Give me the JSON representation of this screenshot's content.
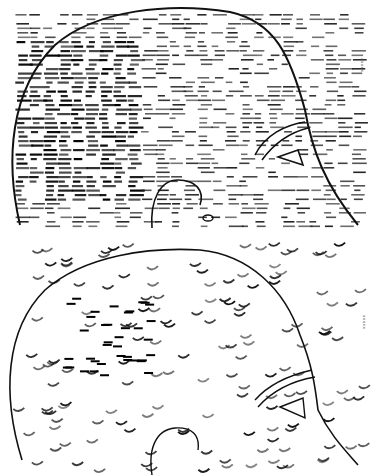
{
  "figure": {
    "panels": [
      {
        "id": "top",
        "label": "a",
        "side_label": "upper head map",
        "mark_style": "dash",
        "y_offset": 0,
        "height": 235,
        "ink": "#111111"
      },
      {
        "id": "bottom",
        "label": "b",
        "side_label": "lower head map",
        "mark_style": "arc",
        "y_offset": 235,
        "height": 240,
        "ink": "#111111"
      }
    ],
    "corner_text_top": "xxxxx",
    "corner_text_bottom": "xxxxx"
  }
}
